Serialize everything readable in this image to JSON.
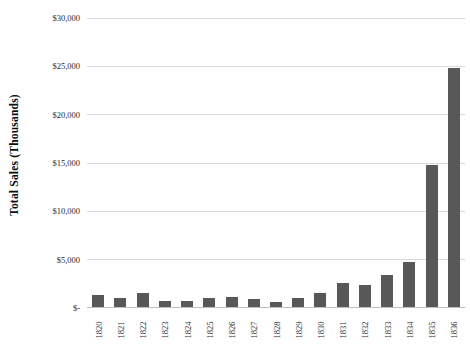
{
  "chart_data": {
    "type": "bar",
    "title": "",
    "subtitle": "",
    "xlabel": "",
    "ylabel": "Total Sales (Thousands)",
    "categories": [
      "1820",
      "1821",
      "1822",
      "1823",
      "1824",
      "1825",
      "1826",
      "1827",
      "1828",
      "1829",
      "1830",
      "1831",
      "1832",
      "1833",
      "1834",
      "1835",
      "1836"
    ],
    "values": [
      1250,
      900,
      1500,
      600,
      650,
      900,
      1000,
      850,
      500,
      900,
      1500,
      2500,
      2300,
      3300,
      4700,
      14700,
      24700
    ],
    "series": [
      {
        "name": "Total Sales",
        "values": [
          1250,
          900,
          1500,
          600,
          650,
          900,
          1000,
          850,
          500,
          900,
          1500,
          2500,
          2300,
          3300,
          4700,
          14700,
          24700
        ]
      }
    ],
    "ylim": [
      0,
      30000
    ],
    "y_ticks": [
      0,
      5000,
      10000,
      15000,
      20000,
      25000,
      30000
    ],
    "y_tick_labels": [
      "$-",
      "$5,000",
      "$10,000",
      "$15,000",
      "$20,000",
      "$25,000",
      "$30,000"
    ],
    "grid": true,
    "grid_axis": "y",
    "legend": false,
    "legend_position": "none",
    "bar_color": "#585858",
    "gridline_color": "#d9d9d9",
    "background_color": "#ffffff",
    "axis_text_color": "#2b2b2b",
    "ylabel_color": "#0d0d0d"
  }
}
